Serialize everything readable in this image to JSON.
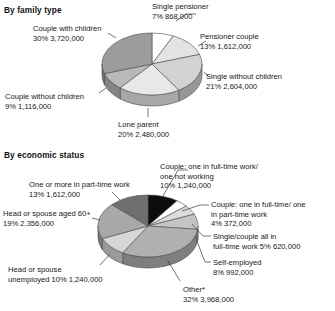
{
  "chart_data": [
    {
      "type": "pie",
      "title": "By family type",
      "xlabel": "",
      "ylabel": "",
      "legend_position": "callout-labels",
      "grid": false,
      "categories": [
        "Single pensioner",
        "Pensioner couple",
        "Single without children",
        "Lone parent",
        "Couple without children",
        "Couple with children"
      ],
      "values": [
        7,
        13,
        21,
        20,
        9,
        30
      ],
      "counts": [
        868000,
        1612000,
        2604000,
        2480000,
        1116000,
        3720000
      ],
      "slices": [
        {
          "label": "Single pensioner",
          "percent": "7%",
          "count": "868,000",
          "value": 7,
          "color": "#ffffff"
        },
        {
          "label": "Pensioner couple",
          "percent": "13%",
          "count": "1,612,000",
          "value": 13,
          "color": "#e3e3e3"
        },
        {
          "label": "Single without children",
          "percent": "21%",
          "count": "2,604,000",
          "value": 21,
          "color": "#d2d2d2"
        },
        {
          "label": "Lone parent",
          "percent": "20%",
          "count": "2,480,000",
          "value": 20,
          "color": "#e8e8e8"
        },
        {
          "label": "Couple without children",
          "percent": "9%",
          "count": "1,116,000",
          "value": 9,
          "color": "#b9b9b9"
        },
        {
          "label": "Couple with children",
          "percent": "30%",
          "count": "3,720,000",
          "value": 30,
          "color": "#9c9c9c"
        }
      ]
    },
    {
      "type": "pie",
      "title": "By economic status",
      "xlabel": "",
      "ylabel": "",
      "legend_position": "callout-labels",
      "grid": false,
      "categories": [
        "Couple: one in full-time work/ one not working",
        "Couple: one in full-time/ one in part-time work",
        "Single/couple all in full-time work",
        "Self-employed",
        "Other*",
        "Head or spouse unemployed",
        "Head or spouse aged 60+",
        "One or more in part-time work"
      ],
      "values": [
        10,
        4,
        5,
        8,
        32,
        10,
        19,
        13
      ],
      "counts": [
        1240000,
        372000,
        620000,
        992000,
        3968000,
        1240000,
        2356000,
        1612000
      ],
      "slices": [
        {
          "label": "Couple: one in full-time work/ one not working",
          "percent": "10%",
          "count": "1,240,000",
          "value": 10,
          "color": "#0d0d0d"
        },
        {
          "label": "Couple: one in full-time/ one in part-time work",
          "percent": "4%",
          "count": "372,000",
          "value": 4,
          "color": "#ffffff"
        },
        {
          "label": "Single/couple all in full-time work",
          "percent": "5%",
          "count": "620,000",
          "value": 5,
          "color": "#dcdcdc"
        },
        {
          "label": "Self-employed",
          "percent": "8%",
          "count": "992,000",
          "value": 8,
          "color": "#c4c4c4"
        },
        {
          "label": "Other*",
          "percent": "32%",
          "count": "3,968,000",
          "value": 32,
          "color": "#b0b0b0"
        },
        {
          "label": "Head or spouse unemployed",
          "percent": "10%",
          "count": "1,240,000",
          "value": 10,
          "color": "#d6d6d6"
        },
        {
          "label": "Head or spouse aged 60+",
          "percent": "19%",
          "count": "2,356,000",
          "value": 19,
          "color": "#a8a8a8"
        },
        {
          "label": "One or more in part-time work",
          "percent": "13%",
          "count": "1,612,000",
          "value": 13,
          "color": "#6f6f6f"
        }
      ]
    }
  ],
  "family": {
    "title": "By family type",
    "labels": {
      "single_pensioner": {
        "name": "Single pensioner",
        "stat": "7%  868,000"
      },
      "pensioner_couple": {
        "name": "Pensioner couple",
        "stat": "13%  1,612,000"
      },
      "single_without_children": {
        "name": "Single without children",
        "stat": "21%  2,604,000"
      },
      "lone_parent": {
        "name": "Lone parent",
        "stat": "20%  2,480,000"
      },
      "couple_without_children": {
        "name": "Couple without children",
        "stat": "9%  1,116,000"
      },
      "couple_with_children": {
        "name": "Couple with children",
        "stat": "30%  3,720,000"
      }
    }
  },
  "economic": {
    "title": "By economic status",
    "labels": {
      "couple_one_ft_one_not": {
        "line1": "Couple: one in full-time work/",
        "line2": "one not working",
        "stat": "10%  1,240,000"
      },
      "couple_one_ft_one_pt": {
        "line1": "Couple: one in full-time/ one",
        "line2": "in part-time work",
        "stat": "4%  372,000"
      },
      "single_couple_all_ft": {
        "line1": "Single/couple all in",
        "line2": "full-time work 5%  620,000"
      },
      "self_employed": {
        "line1": "Self-employed",
        "stat": "8%  992,000"
      },
      "other": {
        "line1": "Other*",
        "stat": "32%  3,968,000"
      },
      "head_unemployed": {
        "line1": "Head or spouse",
        "line2": "unemployed 10%  1,240,000"
      },
      "head_aged_60": {
        "line1": "Head or spouse aged 60+",
        "stat": "19%  2,356,000"
      },
      "part_time_work": {
        "line1": "One or more in part-time work",
        "stat": "13%  1,612,000"
      }
    }
  },
  "colors": {
    "text": "#181818",
    "title": "#111111",
    "outline": "#4a4a4a",
    "leader": "#3a3a3a",
    "background": "#ffffff"
  }
}
